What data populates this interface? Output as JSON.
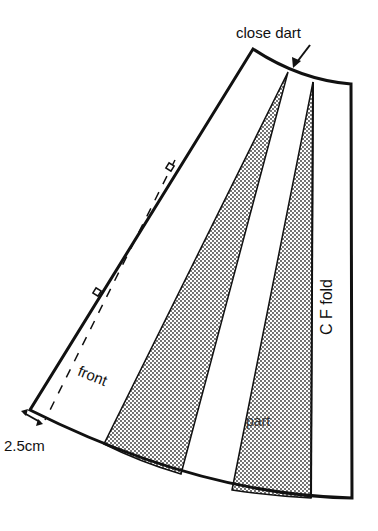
{
  "diagram": {
    "labels": {
      "close_dart": "close dart",
      "front": "front",
      "part": "part",
      "cf_fold": "C F fold",
      "seam_allowance": "2.5cm"
    },
    "colors": {
      "line": "#111111",
      "background": "#ffffff",
      "shading": "#333333"
    },
    "shapes": {
      "outline": "apex(253,49) → waist curve → (351,84) → CF fold down to (352,498) → hem curve → (30,410) → side seam back to apex",
      "shaded_wedges": 2,
      "notches": 2,
      "dashed_seam_line": true
    }
  }
}
